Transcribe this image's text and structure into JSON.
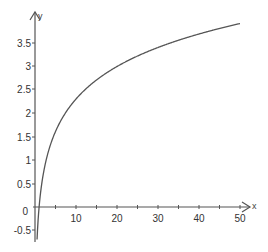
{
  "chart_data": {
    "type": "line",
    "title": "",
    "xlabel": "x",
    "ylabel": "y",
    "xlim": [
      0,
      50
    ],
    "ylim": [
      -0.7,
      3.9
    ],
    "grid": false,
    "legend": null,
    "x_ticks": [
      "10",
      "20",
      "30",
      "40",
      "50"
    ],
    "y_ticks": [
      "-0.5",
      "0",
      "0.5",
      "1",
      "1.5",
      "2",
      "2.5",
      "3",
      "3.5"
    ],
    "series": [
      {
        "name": "y = ln(x)",
        "x": [
          0.5,
          1,
          2,
          3,
          4,
          5,
          7,
          10,
          15,
          20,
          25,
          30,
          35,
          40,
          45,
          50
        ],
        "y": [
          -0.69,
          0,
          0.69,
          1.1,
          1.39,
          1.61,
          1.95,
          2.3,
          2.71,
          3.0,
          3.22,
          3.4,
          3.56,
          3.69,
          3.81,
          3.91
        ]
      }
    ],
    "colors": {
      "curve": "#555555",
      "axes": "#555555"
    }
  },
  "labels": {
    "x_axis_name": "x",
    "y_axis_name": "y",
    "origin": "0",
    "x_ticks": [
      "10",
      "20",
      "30",
      "40",
      "50"
    ],
    "y_ticks": [
      "-0.5",
      "0.5",
      "1",
      "1.5",
      "2",
      "2.5",
      "3",
      "3.5"
    ]
  }
}
